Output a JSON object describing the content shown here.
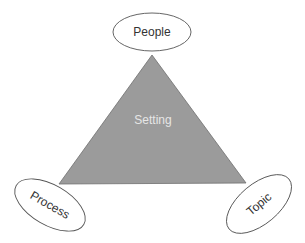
{
  "diagram": {
    "type": "triangle-with-corner-ellipses",
    "center_label": "Setting",
    "nodes": [
      {
        "id": "people",
        "label": "People",
        "position": "top"
      },
      {
        "id": "process",
        "label": "Process",
        "position": "bottom-left"
      },
      {
        "id": "topic",
        "label": "Topic",
        "position": "bottom-right"
      }
    ],
    "colors": {
      "triangle_fill": "#9b9b9b",
      "triangle_stroke": "#6f6f6f",
      "center_text": "#e6e6e6",
      "ellipse_stroke": "#555555",
      "label_text": "#333333"
    }
  }
}
